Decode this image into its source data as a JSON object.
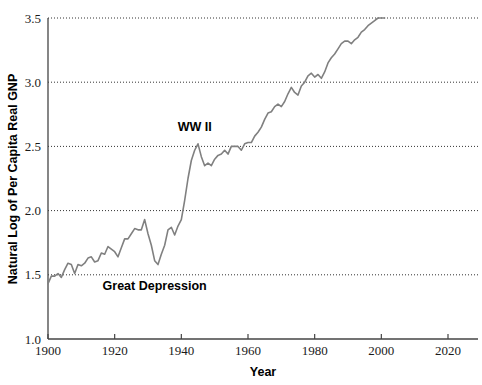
{
  "chart_data": {
    "type": "line",
    "title": "",
    "xlabel": "Year",
    "ylabel": "Natural Log of Per Capita Real GNP",
    "xlim": [
      1900,
      2029
    ],
    "ylim": [
      1.0,
      3.5
    ],
    "xticks": [
      1900,
      1920,
      1940,
      1960,
      1980,
      2000,
      2020
    ],
    "xtick_labels": [
      "1900",
      "1920",
      "1940",
      "1960",
      "1980",
      "2000",
      "2020"
    ],
    "yticks": [
      1.0,
      1.5,
      2.0,
      2.5,
      3.0,
      3.5
    ],
    "ytick_labels": [
      "1.0",
      "1.5",
      "2.0",
      "2.5",
      "3.0",
      "3.5"
    ],
    "grid": {
      "horizontal": true,
      "vertical": false,
      "style": "dotted",
      "values": [
        1.5,
        2.0,
        2.5,
        3.0,
        3.5
      ]
    },
    "legend": null,
    "line_color": "#808080",
    "line_width": 1.6,
    "annotations": [
      {
        "text": "WW II",
        "x": 1944,
        "y": 2.62
      },
      {
        "text": "Great Depression",
        "x": 1932,
        "y": 1.38
      }
    ],
    "series": [
      {
        "name": "Natural Log of Per Capita Real GNP",
        "x": [
          1900,
          1901,
          1902,
          1903,
          1904,
          1905,
          1906,
          1907,
          1908,
          1909,
          1910,
          1911,
          1912,
          1913,
          1914,
          1915,
          1916,
          1917,
          1918,
          1919,
          1920,
          1921,
          1922,
          1923,
          1924,
          1925,
          1926,
          1927,
          1928,
          1929,
          1930,
          1931,
          1932,
          1933,
          1934,
          1935,
          1936,
          1937,
          1938,
          1939,
          1940,
          1941,
          1942,
          1943,
          1944,
          1945,
          1946,
          1947,
          1948,
          1949,
          1950,
          1951,
          1952,
          1953,
          1954,
          1955,
          1956,
          1957,
          1958,
          1959,
          1960,
          1961,
          1962,
          1963,
          1964,
          1965,
          1966,
          1967,
          1968,
          1969,
          1970,
          1971,
          1972,
          1973,
          1974,
          1975,
          1976,
          1977,
          1978,
          1979,
          1980,
          1981,
          1982,
          1983,
          1984,
          1985,
          1986,
          1987,
          1988,
          1989,
          1990,
          1991,
          1992,
          1993,
          1994,
          1995,
          1996,
          1997,
          1998,
          1999,
          2000,
          2001
        ],
        "values": [
          1.43,
          1.49,
          1.49,
          1.51,
          1.48,
          1.54,
          1.59,
          1.58,
          1.51,
          1.58,
          1.57,
          1.59,
          1.63,
          1.64,
          1.6,
          1.61,
          1.67,
          1.66,
          1.72,
          1.7,
          1.68,
          1.64,
          1.71,
          1.78,
          1.78,
          1.82,
          1.86,
          1.85,
          1.85,
          1.93,
          1.82,
          1.73,
          1.61,
          1.58,
          1.66,
          1.73,
          1.85,
          1.87,
          1.81,
          1.88,
          1.93,
          2.08,
          2.25,
          2.39,
          2.47,
          2.52,
          2.42,
          2.35,
          2.37,
          2.35,
          2.4,
          2.43,
          2.44,
          2.47,
          2.44,
          2.5,
          2.5,
          2.5,
          2.47,
          2.52,
          2.53,
          2.53,
          2.58,
          2.61,
          2.65,
          2.71,
          2.76,
          2.77,
          2.81,
          2.83,
          2.81,
          2.85,
          2.91,
          2.96,
          2.92,
          2.9,
          2.97,
          3.0,
          3.05,
          3.07,
          3.04,
          3.06,
          3.03,
          3.08,
          3.15,
          3.19,
          3.22,
          3.26,
          3.3,
          3.32,
          3.32,
          3.3,
          3.33,
          3.35,
          3.39,
          3.41,
          3.44,
          3.46,
          3.48,
          3.5,
          3.5,
          3.5
        ]
      }
    ]
  },
  "axis": {
    "x_title": "Year",
    "y_title": "Natural Log of Per Capita Real GNP"
  },
  "annotations": {
    "ww2": "WW II",
    "great_depression": "Great Depression"
  },
  "colors": {
    "line": "#808080",
    "axis": "#444444",
    "grid": "#333333",
    "text": "#000000",
    "background": "#ffffff"
  }
}
